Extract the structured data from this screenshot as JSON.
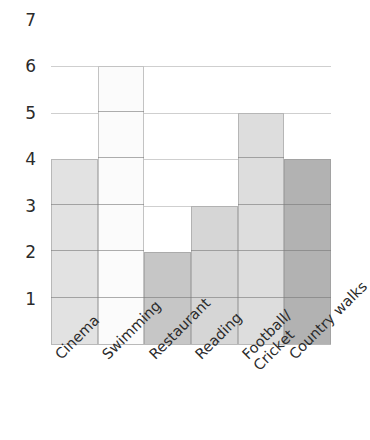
{
  "chart_data": {
    "type": "bar",
    "title": "",
    "subtitle": "",
    "xlabel": "",
    "ylabel": "",
    "categories": [
      "Cinema",
      "Swimming",
      "Restaurant",
      "Reading",
      "Football/Cricket",
      "Country walks"
    ],
    "category_lines": [
      [
        "Cinema"
      ],
      [
        "Swimming"
      ],
      [
        "Restaurant"
      ],
      [
        "Reading"
      ],
      [
        "Football/",
        "Cricket"
      ],
      [
        "Country walks"
      ]
    ],
    "values": [
      4,
      6,
      2,
      3,
      5,
      4
    ],
    "bar_colors": [
      "#e2e2e2",
      "#fbfbfb",
      "#c6c6c6",
      "#d6d6d6",
      "#dddddd",
      "#b2b2b2"
    ],
    "ylim": [
      0,
      7
    ],
    "y_ticks": [
      7,
      6,
      5,
      4,
      3,
      2,
      1
    ],
    "y_tick_labels": [
      "7",
      "6",
      "5",
      "4",
      "3",
      "2",
      "1"
    ],
    "grid": true,
    "grid_orientation": "horizontal",
    "legend": "none",
    "axis_color": "#b9b9b9",
    "gridline_color": "#828282",
    "text_color": "#2b2b2b",
    "background": "#ffffff",
    "x_label_rotation_deg": -45,
    "bar_segmented": true
  }
}
